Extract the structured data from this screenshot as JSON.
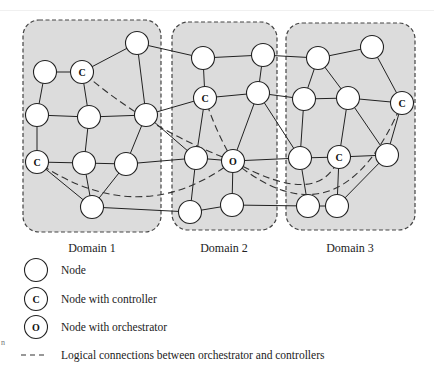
{
  "figure": {
    "type": "multi-domain network topology",
    "colors": {
      "domain_fill": "#dcdcdc",
      "domain_border": "#444444",
      "node_fill": "#ffffff",
      "edge": "#222222"
    }
  },
  "domains": [
    {
      "id": "d1",
      "label": "Domain 1",
      "x": 23,
      "y": 20,
      "w": 138,
      "h": 212,
      "label_x": 92,
      "label_y": 252
    },
    {
      "id": "d2",
      "label": "Domain 2",
      "x": 172,
      "y": 22,
      "w": 105,
      "h": 208,
      "label_x": 224,
      "label_y": 252
    },
    {
      "id": "d3",
      "label": "Domain 3",
      "x": 286,
      "y": 23,
      "w": 129,
      "h": 207,
      "label_x": 350,
      "label_y": 252
    }
  ],
  "nodes": [
    {
      "id": "n1",
      "x": 137,
      "y": 43,
      "type": "node",
      "label": ""
    },
    {
      "id": "c1",
      "x": 82,
      "y": 72,
      "type": "controller",
      "label": "C"
    },
    {
      "id": "n2",
      "x": 45,
      "y": 72,
      "type": "node",
      "label": ""
    },
    {
      "id": "n3",
      "x": 37,
      "y": 115,
      "type": "node",
      "label": ""
    },
    {
      "id": "n4",
      "x": 89,
      "y": 117,
      "type": "node",
      "label": ""
    },
    {
      "id": "n5",
      "x": 146,
      "y": 115,
      "type": "node",
      "label": ""
    },
    {
      "id": "c2",
      "x": 37,
      "y": 162,
      "type": "controller",
      "label": "C"
    },
    {
      "id": "n6",
      "x": 84,
      "y": 163,
      "type": "node",
      "label": ""
    },
    {
      "id": "n7",
      "x": 126,
      "y": 164,
      "type": "node",
      "label": ""
    },
    {
      "id": "n8",
      "x": 92,
      "y": 207,
      "type": "node",
      "label": ""
    },
    {
      "id": "n9",
      "x": 203,
      "y": 58,
      "type": "node",
      "label": ""
    },
    {
      "id": "n10",
      "x": 263,
      "y": 55,
      "type": "node",
      "label": ""
    },
    {
      "id": "c3",
      "x": 205,
      "y": 98,
      "type": "controller",
      "label": "C"
    },
    {
      "id": "n11",
      "x": 258,
      "y": 93,
      "type": "node",
      "label": ""
    },
    {
      "id": "n12",
      "x": 196,
      "y": 158,
      "type": "node",
      "label": ""
    },
    {
      "id": "o1",
      "x": 233,
      "y": 161,
      "type": "orchestrator",
      "label": "O"
    },
    {
      "id": "n13",
      "x": 190,
      "y": 212,
      "type": "node",
      "label": ""
    },
    {
      "id": "n14",
      "x": 232,
      "y": 205,
      "type": "node",
      "label": ""
    },
    {
      "id": "n15",
      "x": 318,
      "y": 58,
      "type": "node",
      "label": ""
    },
    {
      "id": "n16",
      "x": 372,
      "y": 47,
      "type": "node",
      "label": ""
    },
    {
      "id": "n17",
      "x": 304,
      "y": 99,
      "type": "node",
      "label": ""
    },
    {
      "id": "n18",
      "x": 348,
      "y": 98,
      "type": "node",
      "label": ""
    },
    {
      "id": "c4",
      "x": 402,
      "y": 103,
      "type": "controller",
      "label": "C"
    },
    {
      "id": "n19",
      "x": 300,
      "y": 158,
      "type": "node",
      "label": ""
    },
    {
      "id": "c5",
      "x": 339,
      "y": 157,
      "type": "controller",
      "label": "C"
    },
    {
      "id": "n20",
      "x": 387,
      "y": 155,
      "type": "node",
      "label": ""
    },
    {
      "id": "n21",
      "x": 308,
      "y": 206,
      "type": "node",
      "label": ""
    },
    {
      "id": "n22",
      "x": 337,
      "y": 206,
      "type": "node",
      "label": ""
    }
  ],
  "edges": [
    [
      "n2",
      "c1"
    ],
    [
      "c1",
      "n1"
    ],
    [
      "n2",
      "n3"
    ],
    [
      "c1",
      "n4"
    ],
    [
      "n1",
      "n5"
    ],
    [
      "n3",
      "n4"
    ],
    [
      "n4",
      "n5"
    ],
    [
      "n3",
      "c2"
    ],
    [
      "n4",
      "n6"
    ],
    [
      "n5",
      "n7"
    ],
    [
      "c2",
      "n6"
    ],
    [
      "n6",
      "n7"
    ],
    [
      "c2",
      "n8"
    ],
    [
      "n6",
      "n8"
    ],
    [
      "n7",
      "n8"
    ],
    [
      "n1",
      "n9"
    ],
    [
      "n5",
      "c3"
    ],
    [
      "n5",
      "n12"
    ],
    [
      "n7",
      "n12"
    ],
    [
      "n8",
      "n13"
    ],
    [
      "n9",
      "n10"
    ],
    [
      "n9",
      "c3"
    ],
    [
      "c3",
      "n11"
    ],
    [
      "n10",
      "n11"
    ],
    [
      "c3",
      "n12"
    ],
    [
      "n11",
      "o1"
    ],
    [
      "n12",
      "o1"
    ],
    [
      "n12",
      "n13"
    ],
    [
      "n13",
      "n14"
    ],
    [
      "o1",
      "n14"
    ],
    [
      "n10",
      "n15"
    ],
    [
      "n11",
      "n17"
    ],
    [
      "n11",
      "n19"
    ],
    [
      "o1",
      "n19"
    ],
    [
      "n14",
      "n21"
    ],
    [
      "n15",
      "n16"
    ],
    [
      "n15",
      "n17"
    ],
    [
      "n15",
      "n18"
    ],
    [
      "n16",
      "c4"
    ],
    [
      "n17",
      "n18"
    ],
    [
      "n18",
      "c4"
    ],
    [
      "n17",
      "n19"
    ],
    [
      "n18",
      "c5"
    ],
    [
      "n18",
      "n20"
    ],
    [
      "c4",
      "n20"
    ],
    [
      "n19",
      "c5"
    ],
    [
      "c5",
      "n20"
    ],
    [
      "n19",
      "n21"
    ],
    [
      "c5",
      "n22"
    ],
    [
      "n21",
      "n22"
    ],
    [
      "n20",
      "n22"
    ]
  ],
  "logical_connections": [
    {
      "from": "o1",
      "to": "c1",
      "path": "M 233 161 Q 150 130 82 72"
    },
    {
      "from": "o1",
      "to": "c2",
      "path": "M 233 161 Q 140 232 37 162"
    },
    {
      "from": "o1",
      "to": "c3",
      "path": "M 233 161 Q 215 130 205 98"
    },
    {
      "from": "o1",
      "to": "c5",
      "path": "M 233 161 Q 320 210 339 157"
    },
    {
      "from": "o1",
      "to": "c4",
      "path": "M 233 161 Q 340 250 402 103"
    }
  ],
  "legend": {
    "items": [
      {
        "symbol": "node",
        "glyph": "",
        "label": "Node"
      },
      {
        "symbol": "controller",
        "glyph": "C",
        "label": "Node with controller"
      },
      {
        "symbol": "orchestrator",
        "glyph": "O",
        "label": "Node with orchestrator"
      },
      {
        "symbol": "dashed-line",
        "glyph": "- - -",
        "label": "Logical connections between orchestrator and controllers"
      }
    ]
  },
  "margin_mark": "n"
}
